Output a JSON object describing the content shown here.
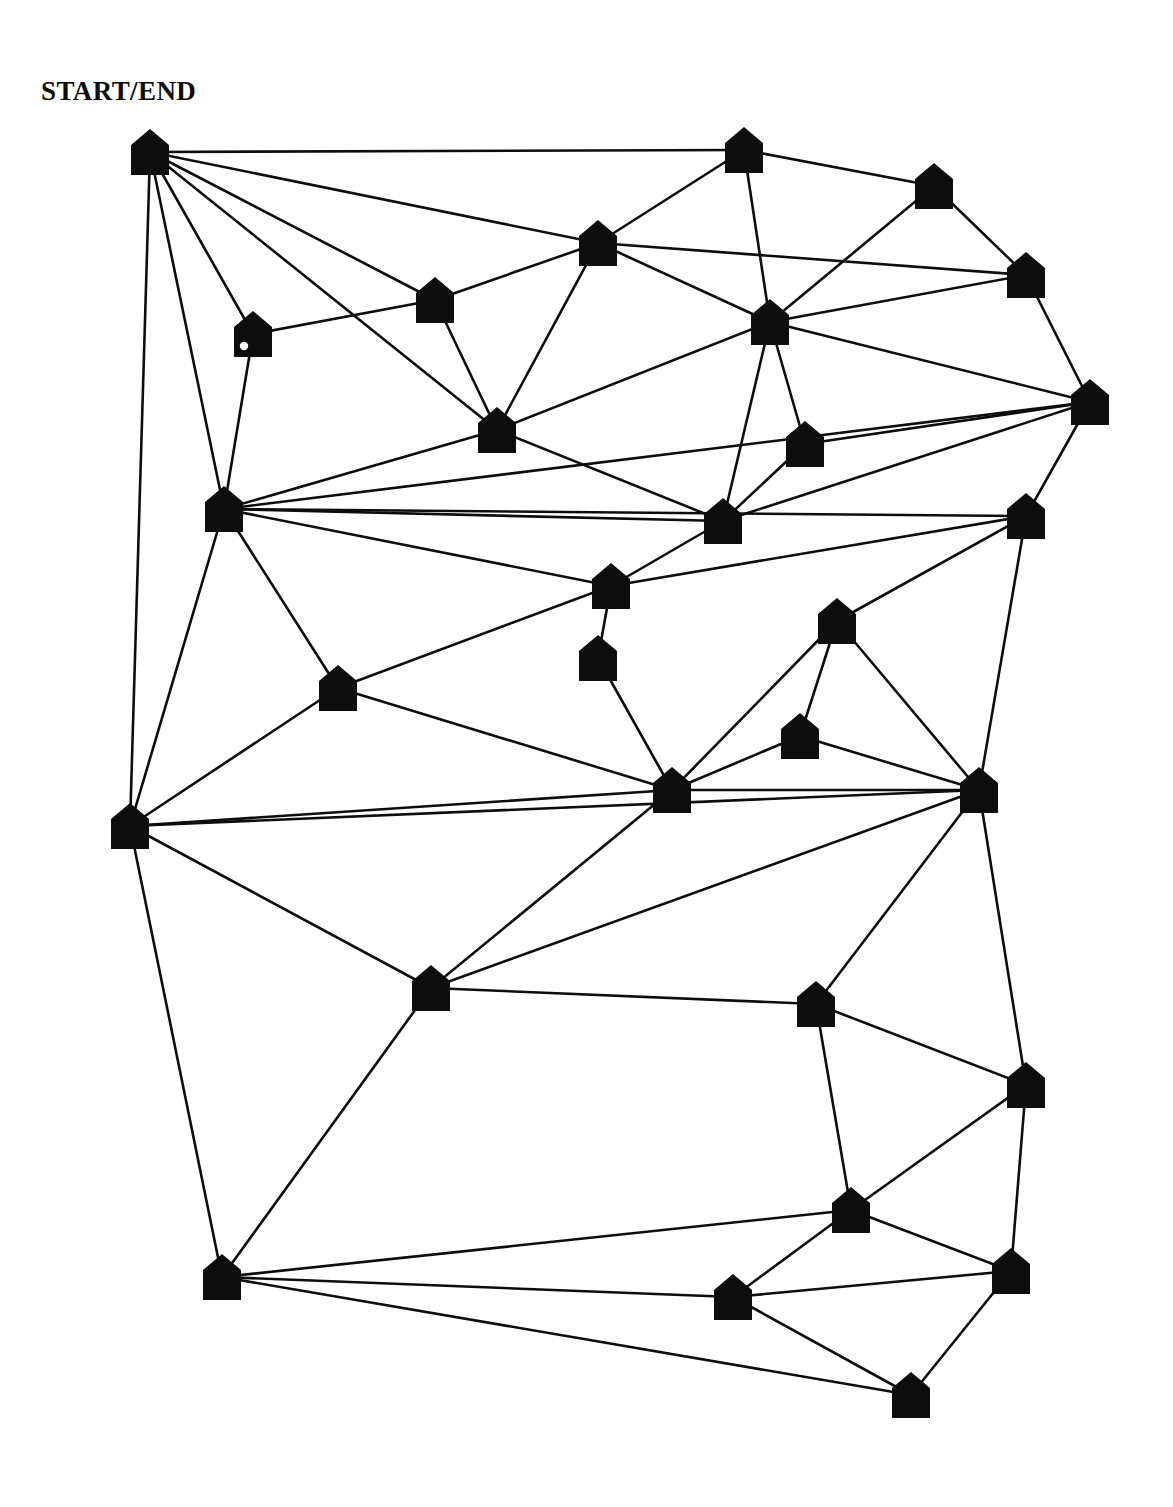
{
  "diagram": {
    "title_label": "START/END",
    "node_shape": "house-pentagon",
    "node_fill": "#0d0d0d",
    "edge_color": "#0d0d0d",
    "background": "#ffffff",
    "canvas": {
      "width": 1173,
      "height": 1507
    },
    "node_size": {
      "width": 38,
      "height": 46,
      "roof_height": 16
    },
    "edge_width": 2.6,
    "nodes": [
      {
        "id": "n1",
        "name": "start-end-node",
        "x": 150,
        "y": 152,
        "marker": null
      },
      {
        "id": "n2",
        "name": "node-top-center",
        "x": 744,
        "y": 150,
        "marker": null
      },
      {
        "id": "n3",
        "name": "node-top-right",
        "x": 934,
        "y": 186,
        "marker": null
      },
      {
        "id": "n4",
        "name": "node-upper-mid",
        "x": 598,
        "y": 243,
        "marker": null
      },
      {
        "id": "n5",
        "name": "node-upper-right",
        "x": 1026,
        "y": 275,
        "marker": null
      },
      {
        "id": "n6",
        "name": "node-upper-left-a",
        "x": 435,
        "y": 300,
        "marker": null
      },
      {
        "id": "n7",
        "name": "node-circle-marker",
        "x": 253,
        "y": 334,
        "marker": "circle"
      },
      {
        "id": "n8",
        "name": "node-center-upper",
        "x": 770,
        "y": 322,
        "marker": null
      },
      {
        "id": "n9",
        "name": "node-right-edge",
        "x": 1090,
        "y": 402,
        "marker": null
      },
      {
        "id": "n10",
        "name": "node-mid-left-a",
        "x": 497,
        "y": 430,
        "marker": null
      },
      {
        "id": "n11",
        "name": "node-mid-center-a",
        "x": 805,
        "y": 444,
        "marker": null
      },
      {
        "id": "n12",
        "name": "node-left-hub",
        "x": 224,
        "y": 509,
        "marker": null
      },
      {
        "id": "n13",
        "name": "node-center-b",
        "x": 723,
        "y": 521,
        "marker": null
      },
      {
        "id": "n14",
        "name": "node-right-b",
        "x": 1026,
        "y": 516,
        "marker": null
      },
      {
        "id": "n15",
        "name": "node-center-c",
        "x": 611,
        "y": 586,
        "marker": null
      },
      {
        "id": "n16",
        "name": "node-center-d",
        "x": 598,
        "y": 658,
        "marker": null
      },
      {
        "id": "n17",
        "name": "node-center-e",
        "x": 837,
        "y": 621,
        "marker": null
      },
      {
        "id": "n18",
        "name": "node-left-mid-b",
        "x": 338,
        "y": 688,
        "marker": null
      },
      {
        "id": "n19",
        "name": "node-small-f",
        "x": 800,
        "y": 736,
        "marker": null
      },
      {
        "id": "n20",
        "name": "node-center-hub",
        "x": 672,
        "y": 790,
        "marker": null
      },
      {
        "id": "n21",
        "name": "node-right-hub",
        "x": 979,
        "y": 790,
        "marker": null
      },
      {
        "id": "n22",
        "name": "node-left-hub-b",
        "x": 130,
        "y": 826,
        "marker": null
      },
      {
        "id": "n23",
        "name": "node-lower-left-a",
        "x": 431,
        "y": 988,
        "marker": null
      },
      {
        "id": "n24",
        "name": "node-lower-center-a",
        "x": 816,
        "y": 1004,
        "marker": null
      },
      {
        "id": "n25",
        "name": "node-lower-right-a",
        "x": 1026,
        "y": 1085,
        "marker": null
      },
      {
        "id": "n26",
        "name": "node-lower-center-b",
        "x": 851,
        "y": 1210,
        "marker": null
      },
      {
        "id": "n27",
        "name": "node-bottom-left",
        "x": 222,
        "y": 1277,
        "marker": null
      },
      {
        "id": "n28",
        "name": "node-lower-right-b",
        "x": 1011,
        "y": 1271,
        "marker": null
      },
      {
        "id": "n29",
        "name": "node-bottom-center-a",
        "x": 733,
        "y": 1297,
        "marker": null
      },
      {
        "id": "n30",
        "name": "node-bottom-center-b",
        "x": 911,
        "y": 1395,
        "marker": null
      }
    ],
    "edges": [
      [
        "n1",
        "n2"
      ],
      [
        "n1",
        "n4"
      ],
      [
        "n1",
        "n6"
      ],
      [
        "n1",
        "n7"
      ],
      [
        "n1",
        "n10"
      ],
      [
        "n1",
        "n12"
      ],
      [
        "n1",
        "n22"
      ],
      [
        "n2",
        "n3"
      ],
      [
        "n2",
        "n4"
      ],
      [
        "n2",
        "n8"
      ],
      [
        "n3",
        "n5"
      ],
      [
        "n3",
        "n8"
      ],
      [
        "n4",
        "n6"
      ],
      [
        "n4",
        "n8"
      ],
      [
        "n4",
        "n10"
      ],
      [
        "n4",
        "n5"
      ],
      [
        "n5",
        "n8"
      ],
      [
        "n5",
        "n9"
      ],
      [
        "n6",
        "n7"
      ],
      [
        "n6",
        "n10"
      ],
      [
        "n7",
        "n12"
      ],
      [
        "n8",
        "n9"
      ],
      [
        "n8",
        "n10"
      ],
      [
        "n8",
        "n11"
      ],
      [
        "n8",
        "n13"
      ],
      [
        "n9",
        "n11"
      ],
      [
        "n9",
        "n13"
      ],
      [
        "n9",
        "n14"
      ],
      [
        "n9",
        "n12"
      ],
      [
        "n10",
        "n12"
      ],
      [
        "n10",
        "n13"
      ],
      [
        "n11",
        "n13"
      ],
      [
        "n12",
        "n13"
      ],
      [
        "n12",
        "n14"
      ],
      [
        "n12",
        "n15"
      ],
      [
        "n12",
        "n18"
      ],
      [
        "n12",
        "n22"
      ],
      [
        "n13",
        "n15"
      ],
      [
        "n14",
        "n15"
      ],
      [
        "n14",
        "n17"
      ],
      [
        "n14",
        "n21"
      ],
      [
        "n15",
        "n16"
      ],
      [
        "n15",
        "n18"
      ],
      [
        "n16",
        "n20"
      ],
      [
        "n17",
        "n20"
      ],
      [
        "n17",
        "n19"
      ],
      [
        "n17",
        "n21"
      ],
      [
        "n18",
        "n20"
      ],
      [
        "n18",
        "n22"
      ],
      [
        "n19",
        "n20"
      ],
      [
        "n19",
        "n21"
      ],
      [
        "n20",
        "n21"
      ],
      [
        "n20",
        "n22"
      ],
      [
        "n20",
        "n23"
      ],
      [
        "n21",
        "n22"
      ],
      [
        "n21",
        "n23"
      ],
      [
        "n21",
        "n24"
      ],
      [
        "n21",
        "n25"
      ],
      [
        "n22",
        "n23"
      ],
      [
        "n22",
        "n27"
      ],
      [
        "n23",
        "n24"
      ],
      [
        "n23",
        "n27"
      ],
      [
        "n24",
        "n25"
      ],
      [
        "n24",
        "n26"
      ],
      [
        "n25",
        "n26"
      ],
      [
        "n25",
        "n28"
      ],
      [
        "n26",
        "n27"
      ],
      [
        "n26",
        "n28"
      ],
      [
        "n26",
        "n29"
      ],
      [
        "n27",
        "n29"
      ],
      [
        "n27",
        "n30"
      ],
      [
        "n28",
        "n29"
      ],
      [
        "n28",
        "n30"
      ],
      [
        "n29",
        "n30"
      ]
    ]
  }
}
